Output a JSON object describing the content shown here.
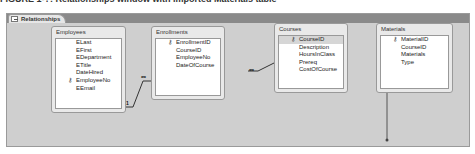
{
  "caption": "FIGURE 1-?: Relationships window with imported Materials table",
  "tab": {
    "label": "Relationships"
  },
  "tables": [
    {
      "name": "Employees",
      "fields": [
        {
          "n": "ELast"
        },
        {
          "n": "EFirst"
        },
        {
          "n": "EDepartment"
        },
        {
          "n": "ETitle"
        },
        {
          "n": "DateHired"
        },
        {
          "n": "EmployeeNo",
          "key": true
        },
        {
          "n": "EEmail"
        }
      ]
    },
    {
      "name": "Enrollments",
      "fields": [
        {
          "n": "EnrollmentID",
          "key": true
        },
        {
          "n": "CourseID"
        },
        {
          "n": "EmployeeNo"
        },
        {
          "n": "DateOfCourse"
        }
      ]
    },
    {
      "name": "Courses",
      "fields": [
        {
          "n": "CourseID",
          "key": true,
          "sel": true
        },
        {
          "n": "Description"
        },
        {
          "n": "HoursInClass"
        },
        {
          "n": "Prereq"
        },
        {
          "n": "CostOfCourse"
        }
      ]
    },
    {
      "name": "Materials",
      "fields": [
        {
          "n": "MaterialID",
          "key": true
        },
        {
          "n": "CourseID"
        },
        {
          "n": "Materials"
        },
        {
          "n": "Type"
        }
      ]
    }
  ],
  "relations": {
    "one": "1",
    "many": "∞"
  },
  "key_glyph": "🔑"
}
